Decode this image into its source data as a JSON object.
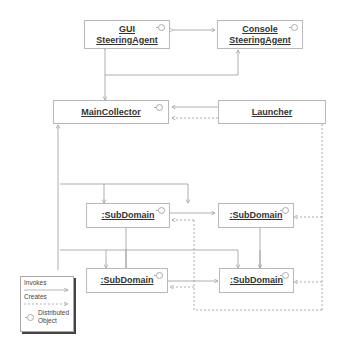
{
  "diagram": {
    "nodes": {
      "gui_agent": {
        "line1": "GUI",
        "line2": "SteeringAgent"
      },
      "console_agent": {
        "line1": "Console",
        "line2": "SteeringAgent"
      },
      "main_collector": {
        "label": "MainCollector"
      },
      "launcher": {
        "label": "Launcher"
      },
      "subdomain_1": {
        "label": ":SubDomain"
      },
      "subdomain_2": {
        "label": ":SubDomain"
      },
      "subdomain_3": {
        "label": ":SubDomain"
      },
      "subdomain_4": {
        "label": ":SubDomain"
      }
    },
    "legend": {
      "invokes": "Invokes",
      "creates": "Creates",
      "distributed_line1": "Distributed",
      "distributed_line2": "Object"
    },
    "colors": {
      "line": "#9a9a9a",
      "border": "#b8b8b8",
      "text": "#333333"
    }
  }
}
